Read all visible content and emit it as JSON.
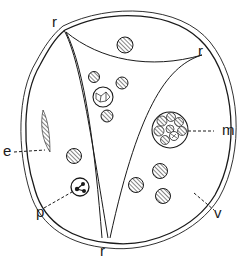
{
  "figure": {
    "type": "biological cell diagram (line drawing)",
    "labels": {
      "r_top_left": "r",
      "r_top_right": "r",
      "r_bottom": "r",
      "e": "e",
      "m": "m",
      "p": "p",
      "v": "v"
    },
    "colors": {
      "ink": "#1a1a1a",
      "background": "#ffffff",
      "hatch": "#555555"
    }
  }
}
